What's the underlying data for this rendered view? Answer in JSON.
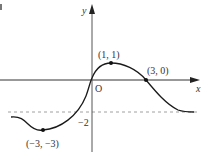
{
  "diagram": {
    "type": "function-graph",
    "axes": {
      "x_label": "x",
      "y_label": "y",
      "origin_label": "O"
    },
    "asymptote": {
      "label": "−2",
      "style": "dashed",
      "y": -2
    },
    "points": [
      {
        "label": "(1, 1)",
        "x": 1,
        "y": 1,
        "kind": "local-maximum"
      },
      {
        "label": "(3, 0)",
        "x": 3,
        "y": 0,
        "kind": "x-intercept"
      },
      {
        "label": "(−3, −3)",
        "x": -3,
        "y": -3,
        "kind": "local-minimum"
      }
    ],
    "colors": {
      "curve": "#1a1a1a",
      "axes": "#333333",
      "dashed": "#888888"
    }
  }
}
